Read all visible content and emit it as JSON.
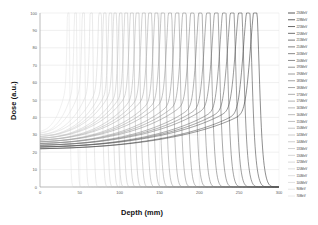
{
  "chart_data": {
    "type": "line",
    "title": "",
    "xlabel": "Depth (mm)",
    "ylabel": "Dose (a.u.)",
    "xlim": [
      0,
      300
    ],
    "ylim": [
      0,
      100
    ],
    "xticks": [
      0,
      50,
      100,
      150,
      200,
      250,
      300
    ],
    "yticks": [
      0,
      10,
      20,
      30,
      40,
      50,
      60,
      70,
      80,
      90,
      100
    ],
    "grid": true,
    "legend_position": "right",
    "legend_title": "",
    "series": [
      {
        "name": "230MeV",
        "peak_depth": 271,
        "peak_dose": 88,
        "entrance_dose": 22,
        "color": "#2f2f2f"
      },
      {
        "name": "228MeV",
        "peak_depth": 262,
        "peak_dose": 88,
        "entrance_dose": 22,
        "color": "#3a3a3a"
      },
      {
        "name": "225MeV",
        "peak_depth": 252,
        "peak_dose": 88,
        "entrance_dose": 23,
        "color": "#444444"
      },
      {
        "name": "220MeV",
        "peak_depth": 242,
        "peak_dose": 89,
        "entrance_dose": 23,
        "color": "#4e4e4e"
      },
      {
        "name": "215MeV",
        "peak_depth": 232,
        "peak_dose": 89,
        "entrance_dose": 23,
        "color": "#585858"
      },
      {
        "name": "210MeV",
        "peak_depth": 222,
        "peak_dose": 89,
        "entrance_dose": 24,
        "color": "#626262"
      },
      {
        "name": "205MeV",
        "peak_depth": 212,
        "peak_dose": 90,
        "entrance_dose": 24,
        "color": "#6b6b6b"
      },
      {
        "name": "200MeV",
        "peak_depth": 202,
        "peak_dose": 90,
        "entrance_dose": 24,
        "color": "#747474"
      },
      {
        "name": "195MeV",
        "peak_depth": 192,
        "peak_dose": 90,
        "entrance_dose": 25,
        "color": "#7c7c7c"
      },
      {
        "name": "190MeV",
        "peak_depth": 182,
        "peak_dose": 91,
        "entrance_dose": 25,
        "color": "#848484"
      },
      {
        "name": "185MeV",
        "peak_depth": 173,
        "peak_dose": 91,
        "entrance_dose": 25,
        "color": "#8b8b8b"
      },
      {
        "name": "180MeV",
        "peak_depth": 164,
        "peak_dose": 92,
        "entrance_dose": 26,
        "color": "#929292"
      },
      {
        "name": "175MeV",
        "peak_depth": 155,
        "peak_dose": 92,
        "entrance_dose": 26,
        "color": "#999999"
      },
      {
        "name": "170MeV",
        "peak_depth": 147,
        "peak_dose": 93,
        "entrance_dose": 26,
        "color": "#a0a0a0"
      },
      {
        "name": "165MeV",
        "peak_depth": 139,
        "peak_dose": 93,
        "entrance_dose": 27,
        "color": "#a6a6a6"
      },
      {
        "name": "160MeV",
        "peak_depth": 131,
        "peak_dose": 94,
        "entrance_dose": 27,
        "color": "#acacac"
      },
      {
        "name": "155MeV",
        "peak_depth": 123,
        "peak_dose": 94,
        "entrance_dose": 27,
        "color": "#b2b2b2"
      },
      {
        "name": "150MeV",
        "peak_depth": 116,
        "peak_dose": 95,
        "entrance_dose": 28,
        "color": "#b8b8b8"
      },
      {
        "name": "145MeV",
        "peak_depth": 109,
        "peak_dose": 95,
        "entrance_dose": 28,
        "color": "#bdbdbd"
      },
      {
        "name": "140MeV",
        "peak_depth": 102,
        "peak_dose": 96,
        "entrance_dose": 28,
        "color": "#c2c2c2"
      },
      {
        "name": "135MeV",
        "peak_depth": 95,
        "peak_dose": 96,
        "entrance_dose": 29,
        "color": "#c7c7c7"
      },
      {
        "name": "130MeV",
        "peak_depth": 89,
        "peak_dose": 97,
        "entrance_dose": 29,
        "color": "#cbcbcb"
      },
      {
        "name": "125MeV",
        "peak_depth": 82,
        "peak_dose": 97,
        "entrance_dose": 29,
        "color": "#d0d0d0"
      },
      {
        "name": "120MeV",
        "peak_depth": 76,
        "peak_dose": 98,
        "entrance_dose": 30,
        "color": "#d4d4d4"
      },
      {
        "name": "110MeV",
        "peak_depth": 65,
        "peak_dose": 99,
        "entrance_dose": 30,
        "color": "#d8d8d8"
      },
      {
        "name": "100MeV",
        "peak_depth": 55,
        "peak_dose": 99,
        "entrance_dose": 31,
        "color": "#dcdcdc"
      },
      {
        "name": "90MeV",
        "peak_depth": 45,
        "peak_dose": 100,
        "entrance_dose": 31,
        "color": "#e0e0e0"
      },
      {
        "name": "70MeV",
        "peak_depth": 36,
        "peak_dose": 100,
        "entrance_dose": 32,
        "color": "#e4e4e4"
      }
    ]
  }
}
